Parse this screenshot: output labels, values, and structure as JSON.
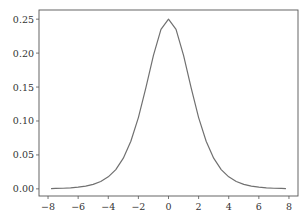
{
  "chart_data": {
    "type": "line",
    "title": "",
    "xlabel": "",
    "ylabel": "",
    "xlim": [
      -8.6,
      8.6
    ],
    "ylim": [
      -0.0105,
      0.2635
    ],
    "grid": false,
    "legend": null,
    "x_ticks": [
      -8,
      -6,
      -4,
      -2,
      0,
      2,
      4,
      6,
      8
    ],
    "x_tick_labels": [
      "−8",
      "−6",
      "−4",
      "−2",
      "0",
      "2",
      "4",
      "6",
      "8"
    ],
    "y_ticks": [
      0.0,
      0.05,
      0.1,
      0.15,
      0.2,
      0.25
    ],
    "y_tick_labels": [
      "0.00",
      "0.05",
      "0.10",
      "0.15",
      "0.20",
      "0.25"
    ],
    "series": [
      {
        "name": "logistic pdf",
        "color": "#707070",
        "x": [
          -7.8,
          -7.5,
          -7.0,
          -6.5,
          -6.0,
          -5.5,
          -5.0,
          -4.5,
          -4.0,
          -3.5,
          -3.0,
          -2.5,
          -2.0,
          -1.5,
          -1.0,
          -0.5,
          0.0,
          0.5,
          1.0,
          1.5,
          2.0,
          2.5,
          3.0,
          3.5,
          4.0,
          4.5,
          5.0,
          5.5,
          6.0,
          6.5,
          7.0,
          7.5,
          7.8
        ],
        "y": [
          0.0004,
          0.0006,
          0.0009,
          0.0015,
          0.0025,
          0.0041,
          0.0066,
          0.0109,
          0.0177,
          0.0284,
          0.0452,
          0.0701,
          0.105,
          0.1491,
          0.1966,
          0.235,
          0.25,
          0.235,
          0.1966,
          0.1491,
          0.105,
          0.0701,
          0.0452,
          0.0284,
          0.0177,
          0.0109,
          0.0066,
          0.0041,
          0.0025,
          0.0015,
          0.0009,
          0.0006,
          0.0004
        ]
      }
    ]
  },
  "colors": {
    "axes": "#555555",
    "line": "#707070",
    "text": "#333333"
  },
  "layout": {
    "frame": {
      "left": 39,
      "top": 10,
      "right": 298,
      "bottom": 196
    }
  }
}
